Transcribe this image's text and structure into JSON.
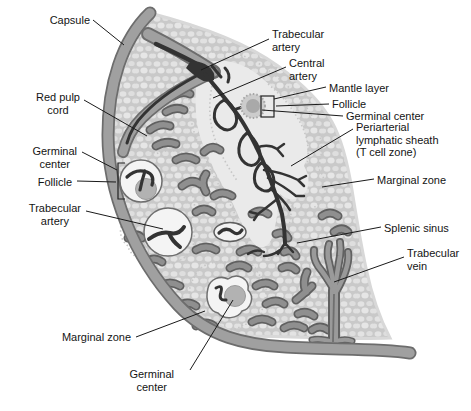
{
  "labels": {
    "capsule": "Capsule",
    "red_pulp_cord": "Red pulp\ncord",
    "germinal_center_left": "Germinal\ncenter",
    "follicle_left": "Follicle",
    "trabecular_artery_left": "Trabecular\nartery",
    "marginal_zone_bottom": "Marginal zone",
    "germinal_center_bottom": "Germinal\ncenter",
    "trabecular_artery_top": "Trabecular\nartery",
    "central_artery": "Central\nartery",
    "mantle_layer": "Mantle layer",
    "follicle_right": "Follicle",
    "germinal_center_right": "Germinal center",
    "periarterial_lymphatic_sheath": "Periarterial\nlymphatic sheath\n(T cell zone)",
    "marginal_zone_right": "Marginal zone",
    "splenic_sinus": "Splenic sinus",
    "trabecular_vein": "Trabecular\nvein"
  },
  "colors": {
    "background": "#ffffff",
    "capsule-fill": "#a0a0a0",
    "capsule-edge": "#6d6d6d",
    "tissue-base": "#c9c9c9",
    "tissue-cell": "#e3e3e3",
    "sheath-outer": "#d6d6d6",
    "sheath-inner": "#eaeaea",
    "halo-fill": "#dcdcdc",
    "sinus-fill": "#8f8f8f",
    "sinus-edge": "#606060",
    "artery-dark": "#333333",
    "follicle-fill": "#f4f4f4",
    "follicle-edge": "#6e6e6e",
    "germinal-fill": "#b2b2b2",
    "mantle-fill": "#cccccc",
    "vein-fill": "#9a9a9a",
    "vein-edge": "#616161",
    "label-text": "#141414",
    "leader-line": "#1a1a1a"
  }
}
